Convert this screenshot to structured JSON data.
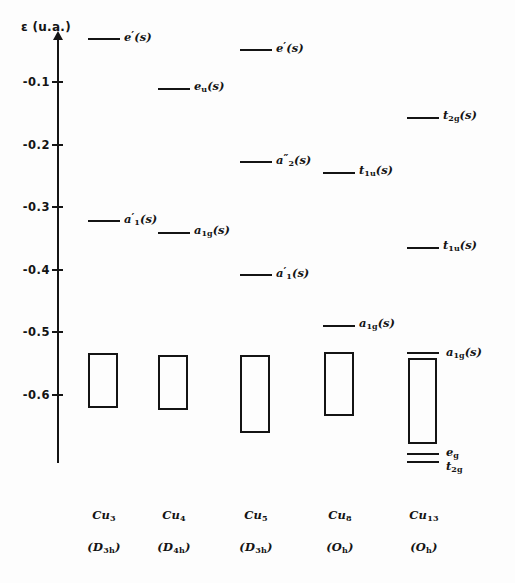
{
  "figure": {
    "domain_kind": "energy-level-diagram",
    "background_color": "#fdfdfd",
    "ink_color": "#141414"
  },
  "axis": {
    "title": "ε (u.a.)",
    "unit": "u.a.",
    "symbol": "ε",
    "tick_labels": [
      "-0.1",
      "-0.2",
      "-0.3",
      "-0.4",
      "-0.5",
      "-0.6"
    ],
    "tick_values": [
      -0.1,
      -0.2,
      -0.3,
      -0.4,
      -0.5,
      -0.6
    ],
    "range_top": 0.0,
    "range_bottom": -0.655,
    "has_arrow_head": true
  },
  "columns": [
    {
      "id": "cu3",
      "cluster": "Cu",
      "cluster_sub": "3",
      "symmetry": "(D",
      "symmetry_sub": "3h",
      "symmetry_close": ")",
      "caption_formula": "Cu3",
      "caption_symmetry": "(D3h)",
      "levels": [
        {
          "label_main": "e",
          "label_prime": "′",
          "label_sub": "",
          "label_tail": "(s)",
          "energy": -0.031
        },
        {
          "label_main": "a",
          "label_prime": "′",
          "label_sub": "1",
          "label_tail": "(s)",
          "energy": -0.322
        }
      ],
      "band": {
        "top_energy": -0.433,
        "bottom_energy": -0.52,
        "label": ""
      }
    },
    {
      "id": "cu4",
      "cluster": "Cu",
      "cluster_sub": "4",
      "symmetry": "(D",
      "symmetry_sub": "4h",
      "symmetry_close": ")",
      "caption_formula": "Cu4",
      "caption_symmetry": "(D4h)",
      "levels": [
        {
          "label_main": "e",
          "label_prime": "",
          "label_sub": "u",
          "label_tail": "(s)",
          "energy": -0.111
        },
        {
          "label_main": "a",
          "label_prime": "",
          "label_sub": "1g",
          "label_tail": "(s)",
          "energy": -0.341
        }
      ],
      "band": {
        "top_energy": -0.436,
        "bottom_energy": -0.524,
        "label": ""
      }
    },
    {
      "id": "cu5",
      "cluster": "Cu",
      "cluster_sub": "5",
      "symmetry": "(D",
      "symmetry_sub": "3h",
      "symmetry_close": ")",
      "caption_formula": "Cu5",
      "caption_symmetry": "(D3h)",
      "levels": [
        {
          "label_main": "e",
          "label_prime": "′",
          "label_sub": "",
          "label_tail": "(s)",
          "energy": -0.049
        },
        {
          "label_main": "a",
          "label_prime": "″",
          "label_sub": "2",
          "label_tail": "(s)",
          "energy": -0.228
        },
        {
          "label_main": "a",
          "label_prime": "′",
          "label_sub": "1",
          "label_tail": "(s)",
          "energy": -0.409
        }
      ],
      "band": {
        "top_energy": -0.436,
        "bottom_energy": -0.559,
        "label": ""
      }
    },
    {
      "id": "cu8",
      "cluster": "Cu",
      "cluster_sub": "8",
      "symmetry": "(O",
      "symmetry_sub": "h",
      "symmetry_close": ")",
      "caption_formula": "Cu8",
      "caption_symmetry": "(Oh)",
      "levels": [
        {
          "label_main": "t",
          "label_prime": "",
          "label_sub": "1u",
          "label_tail": "(s)",
          "energy": -0.215
        },
        {
          "label_main": "a",
          "label_prime": "",
          "label_sub": "1g",
          "label_tail": "(s)",
          "energy": -0.412
        }
      ],
      "band": {
        "top_energy": -0.432,
        "bottom_energy": -0.534,
        "label": ""
      }
    },
    {
      "id": "cu13",
      "cluster": "Cu",
      "cluster_sub": "13",
      "symmetry": "(O",
      "symmetry_sub": "h",
      "symmetry_close": ")",
      "caption_formula": "Cu13",
      "caption_symmetry": "(Oh)",
      "levels": [
        {
          "label_main": "t",
          "label_prime": "",
          "label_sub": "2g",
          "label_tail": "(s)",
          "energy": -0.146
        },
        {
          "label_main": "t",
          "label_prime": "",
          "label_sub": "1u",
          "label_tail": "(s)",
          "energy": -0.306
        }
      ],
      "top_line": {
        "label_main": "a",
        "label_sub": "1g",
        "label_tail": "(s)",
        "energy": -0.533
      },
      "band": {
        "top_energy": -0.541,
        "bottom_energy": -0.677,
        "label": ""
      },
      "bottom_lines": [
        {
          "label_main": "e",
          "label_sub": "g",
          "label_tail": "",
          "energy": -0.697
        },
        {
          "label_main": "t",
          "label_sub": "2g",
          "label_tail": "",
          "energy": -0.709
        }
      ]
    }
  ]
}
